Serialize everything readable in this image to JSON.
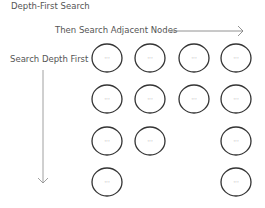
{
  "title": "Depth-First Search",
  "horizontal_label": "Then Search Adjacent Nodes",
  "vertical_label": "Search Depth First",
  "node_text": "···",
  "colors": {
    "stroke": "#333333",
    "arrow": "#888888",
    "text": "#555555"
  },
  "nodes": [
    {
      "row": 1,
      "col": 1
    },
    {
      "row": 1,
      "col": 2
    },
    {
      "row": 1,
      "col": 3
    },
    {
      "row": 1,
      "col": 4
    },
    {
      "row": 2,
      "col": 1
    },
    {
      "row": 2,
      "col": 2
    },
    {
      "row": 2,
      "col": 3
    },
    {
      "row": 2,
      "col": 4
    },
    {
      "row": 3,
      "col": 1
    },
    {
      "row": 3,
      "col": 2
    },
    {
      "row": 3,
      "col": 4
    },
    {
      "row": 4,
      "col": 1
    },
    {
      "row": 4,
      "col": 4
    }
  ]
}
